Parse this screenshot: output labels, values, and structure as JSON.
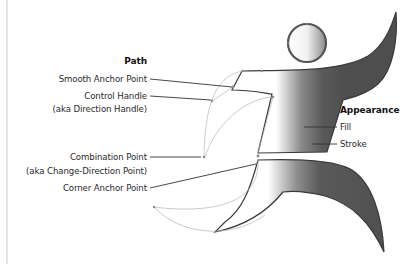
{
  "path_section": {
    "heading": "Path",
    "smooth_anchor": "Smooth Anchor Point",
    "control_handle": "Control Handle",
    "control_handle_aka": "(aka Direction Handle)",
    "combination_point": "Combination Point",
    "combination_point_aka": "(aka Change-Direction Point)",
    "corner_anchor": "Corner Anchor Point"
  },
  "appearance_section": {
    "heading": "Appearance",
    "fill": "Fill",
    "stroke": "Stroke"
  },
  "figure": {
    "fill_gradient": [
      "#ffffff",
      "#555555"
    ],
    "stroke_color": "#3a3a3a",
    "path_color": "#b0b0b0",
    "leader_color": "#333333"
  }
}
